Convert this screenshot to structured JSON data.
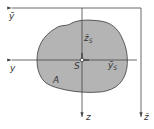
{
  "diagram": {
    "type": "cross-section-centroid",
    "colors": {
      "area_fill": "#b4b4b4",
      "outline": "#3a3a3a",
      "axis": "#444444",
      "background": "#ffffff"
    },
    "labels": {
      "y_bar_axis": "ȳ",
      "z_bar_s": "z̄",
      "z_bar_s_sub": "S",
      "centroid": "S",
      "y_bar_s": "ȳ",
      "y_bar_s_sub": "S",
      "y_axis": "y",
      "area": "A",
      "z_axis": "z",
      "z_bar_axis": "z̄"
    }
  }
}
